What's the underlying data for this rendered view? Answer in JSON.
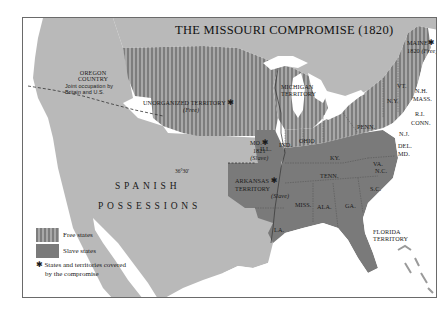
{
  "map": {
    "title": "THE MISSOURI COMPROMISE (1820)",
    "colors": {
      "water": "#ffffff",
      "unclaimed_land": "#b9b9b9",
      "free_stripe_dark": "#7d7d7d",
      "free_stripe_light": "#a8a8a8",
      "slave": "#7a7a7a",
      "border": "#6a6a6a",
      "text": "#1a1a1a"
    },
    "regions": {
      "oregon": {
        "name_line1": "OREGON",
        "name_line2": "COUNTRY",
        "note_line1": "Joint occupation by",
        "note_line2": "Britain and U.S."
      },
      "unorganized": {
        "name": "UNORGANIZED TERRITORY",
        "status": "(Free)",
        "star": "✱"
      },
      "michigan": {
        "line1": "MICHIGAN",
        "line2": "TERRITORY"
      },
      "missouri": {
        "name": "MO.",
        "year": "1821",
        "status": "(Slave)",
        "star": "✱"
      },
      "arkansas": {
        "line1": "ARKANSAS",
        "line2": "TERRITORY",
        "status": "(Slave)",
        "star": "✱"
      },
      "maine": {
        "name": "MAINE",
        "year": "1820",
        "status": "(Free)",
        "star": "✱"
      },
      "florida": {
        "line1": "FLORIDA",
        "line2": "TERRITORY"
      },
      "spanish": {
        "line1": "SPANISH",
        "line2": "POSSESSIONS"
      },
      "latitude_label": "36°30'"
    },
    "states": {
      "ill": "ILL.",
      "ind": "IND.",
      "ohio": "OHIO",
      "penn": "PENN.",
      "ny": "N.Y.",
      "vt": "VT.",
      "nh": "N.H.",
      "mass": "MASS.",
      "ri": "R.I.",
      "conn": "CONN.",
      "nj": "N.J.",
      "del": "DEL.",
      "md": "MD.",
      "va": "VA.",
      "ky": "KY.",
      "tenn": "TENN.",
      "nc": "N.C.",
      "sc": "S.C.",
      "ga": "GA.",
      "ala": "ALA.",
      "miss": "MISS.",
      "la": "LA."
    },
    "legend": {
      "free": "Free states",
      "slave": "Slave states",
      "star": "✱",
      "note_line1": "States and territories covered",
      "note_line2": "by the compromise"
    }
  }
}
